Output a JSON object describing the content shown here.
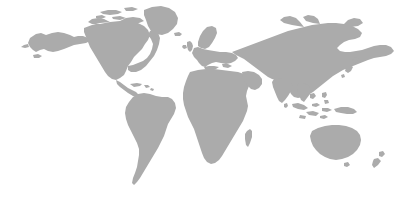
{
  "figure": {
    "name": "world-map-silhouette",
    "caption": "Grey silhouette world map on a white background",
    "width_px": 419,
    "height_px": 199,
    "background_color": "#ffffff",
    "land_color": "#ababab",
    "projection": "equirectangular-robinson-like",
    "has_labels": false,
    "has_graticule": false,
    "has_borders": false,
    "has_antarctica": false
  },
  "legend": {
    "visible": false,
    "entries": []
  },
  "regions": [
    {
      "id": "alaska",
      "label": "Alaska"
    },
    {
      "id": "north-america",
      "label": "North America"
    },
    {
      "id": "greenland",
      "label": "Greenland"
    },
    {
      "id": "canadian-arctic",
      "label": "Canadian Arctic Archipelago"
    },
    {
      "id": "central-america",
      "label": "Central America"
    },
    {
      "id": "caribbean",
      "label": "Caribbean Islands"
    },
    {
      "id": "south-america",
      "label": "South America"
    },
    {
      "id": "iceland",
      "label": "Iceland"
    },
    {
      "id": "british-isles",
      "label": "British Isles"
    },
    {
      "id": "scandinavia",
      "label": "Scandinavia"
    },
    {
      "id": "europe",
      "label": "Europe"
    },
    {
      "id": "africa",
      "label": "Africa"
    },
    {
      "id": "madagascar",
      "label": "Madagascar"
    },
    {
      "id": "arabia",
      "label": "Arabian Peninsula"
    },
    {
      "id": "asia",
      "label": "Asia"
    },
    {
      "id": "india",
      "label": "Indian Subcontinent"
    },
    {
      "id": "japan",
      "label": "Japan"
    },
    {
      "id": "southeast-asia",
      "label": "Southeast Asia"
    },
    {
      "id": "indonesia",
      "label": "Indonesian Archipelago"
    },
    {
      "id": "philippines",
      "label": "Philippines"
    },
    {
      "id": "new-guinea",
      "label": "New Guinea"
    },
    {
      "id": "australia",
      "label": "Australia"
    },
    {
      "id": "tasmania",
      "label": "Tasmania"
    },
    {
      "id": "new-zealand",
      "label": "New Zealand"
    },
    {
      "id": "sri-lanka",
      "label": "Sri Lanka"
    }
  ]
}
